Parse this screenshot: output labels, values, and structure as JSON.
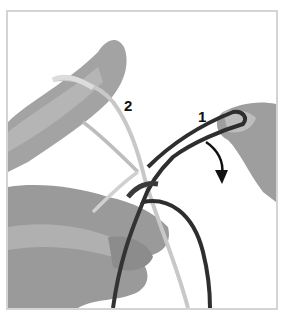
{
  "figure": {
    "labels": {
      "cord_2": "2",
      "cord_1": "1"
    },
    "arrow": "curved-down-arrow",
    "colors": {
      "frame": "#d4d4d4",
      "skin": "#9a9a9a",
      "skin_light": "#b8b8b8",
      "cord_light": "#c8c8c8",
      "cord_dark": "#2e2e2e",
      "text": "#111111"
    }
  }
}
